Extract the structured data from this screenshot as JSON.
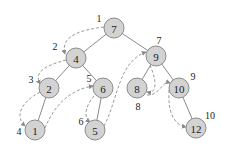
{
  "diagram": {
    "type": "binary-search-tree-traversal",
    "colors": {
      "node_fill": "#d3d3d3",
      "node_stroke": "#8c8c8c",
      "edge": "#8a8a8a",
      "traversal_path": "#9a9a9a",
      "text": "#222222"
    },
    "nodes": [
      {
        "id": "n7",
        "label": "7",
        "x": 114,
        "y": 28,
        "order": "1",
        "ox": 99,
        "oy": 18
      },
      {
        "id": "n4",
        "label": "4",
        "x": 76,
        "y": 58,
        "order": "2",
        "ox": 55,
        "oy": 46
      },
      {
        "id": "n9",
        "label": "9",
        "x": 156,
        "y": 56,
        "order": "7",
        "ox": 159,
        "oy": 40
      },
      {
        "id": "n2",
        "label": "2",
        "x": 49,
        "y": 88,
        "order": "3",
        "ox": 31,
        "oy": 79
      },
      {
        "id": "n6",
        "label": "6",
        "x": 103,
        "y": 88,
        "order": "5",
        "ox": 89,
        "oy": 78
      },
      {
        "id": "n8",
        "label": "8",
        "x": 137,
        "y": 88,
        "order": "8",
        "ox": 138,
        "oy": 106
      },
      {
        "id": "n10",
        "label": "10",
        "x": 179,
        "y": 88,
        "order": "9",
        "ox": 193,
        "oy": 76
      },
      {
        "id": "n1",
        "label": "1",
        "x": 35,
        "y": 130,
        "order": "4",
        "ox": 19,
        "oy": 131
      },
      {
        "id": "n5",
        "label": "5",
        "x": 95,
        "y": 130,
        "order": "6",
        "ox": 81,
        "oy": 121
      },
      {
        "id": "n12",
        "label": "12",
        "x": 196,
        "y": 128,
        "order": "10",
        "ox": 210,
        "oy": 115
      }
    ],
    "edges": [
      [
        "n7",
        "n4"
      ],
      [
        "n7",
        "n9"
      ],
      [
        "n4",
        "n2"
      ],
      [
        "n4",
        "n6"
      ],
      [
        "n2",
        "n1"
      ],
      [
        "n6",
        "n5"
      ],
      [
        "n9",
        "n8"
      ],
      [
        "n9",
        "n10"
      ],
      [
        "n10",
        "n12"
      ]
    ],
    "traversal": [
      "n7",
      "n4",
      "n2",
      "n1",
      "n6",
      "n5",
      "n9",
      "n8",
      "n10",
      "n12"
    ]
  }
}
